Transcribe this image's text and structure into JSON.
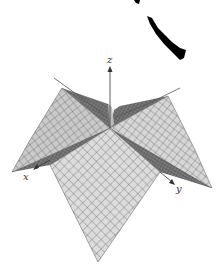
{
  "figure": {
    "type": "3d-surface-plot",
    "axes": {
      "x_label": "x",
      "y_label": "y",
      "z_label": "z"
    },
    "colors": {
      "background": "#ffffff",
      "surface_light": "#d9d9d9",
      "surface_mid": "#b5b5b5",
      "surface_dark": "#6a6a6a",
      "grid_line": "#4a4a4a",
      "axis": "#333333",
      "ink_artifact": "#000000"
    }
  }
}
